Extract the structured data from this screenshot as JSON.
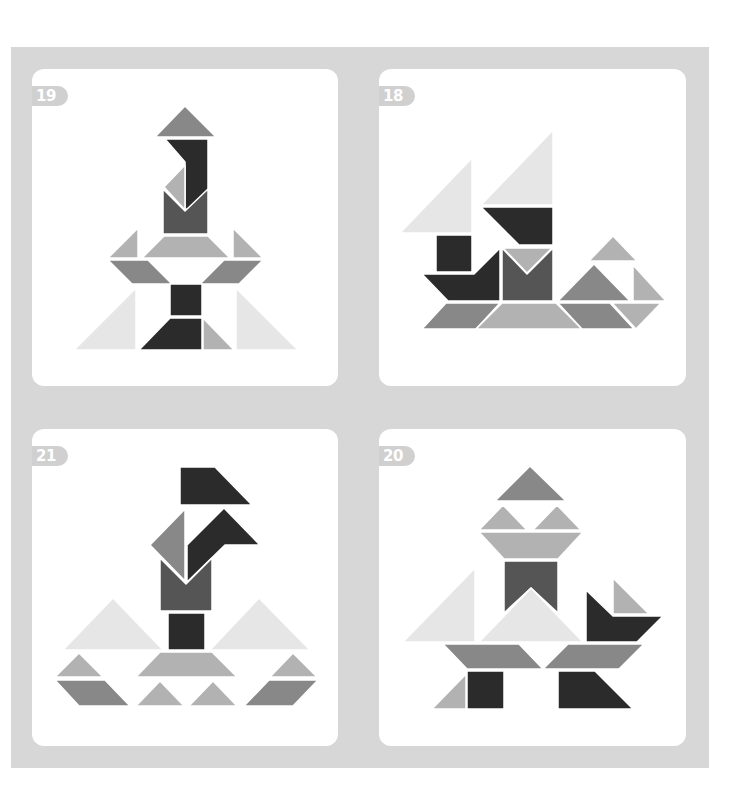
{
  "colors": {
    "frame": "#d7d7d7",
    "card": "#ffffff",
    "badge": "#d0d0d0",
    "darkest": "#2b2b2b",
    "dark": "#555555",
    "mid": "#888888",
    "light": "#b2b2b2",
    "pale": "#e6e6e6"
  },
  "puzzles": [
    {
      "number": "19",
      "position": "top-left"
    },
    {
      "number": "18",
      "position": "top-right"
    },
    {
      "number": "21",
      "position": "bottom-left"
    },
    {
      "number": "20",
      "position": "bottom-right"
    }
  ]
}
